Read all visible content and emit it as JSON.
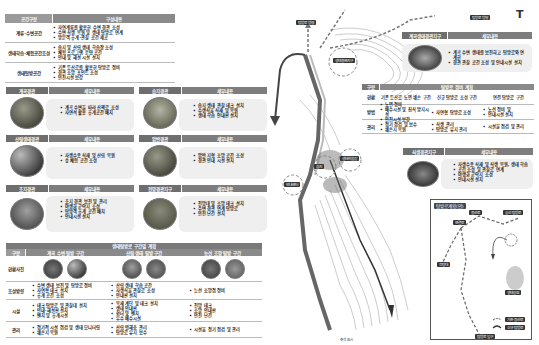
{
  "top_table": {
    "header": [
      "공간구분",
      "구성내용"
    ],
    "rows": [
      {
        "label": "계류·수변공간",
        "items": [
          "자연계류를 활용한 수변 경관 조성",
          "수변 식생 복원 및 생태 탐방로 연계",
          "방문객 휴게·관찰 공간 제공"
        ]
      },
      {
        "label": "생태학습·체험공간조성",
        "items": [
          "습지 및 산림 생태 학습장 조성",
          "체험 프로그램 운영 공간",
          "안내 및 해설 시설 설치"
        ]
      },
      {
        "label": "생태탐방공간",
        "items": [
          "기존 등산로를 활용한 탐방로 정비",
          "경관 조망 포인트 조성",
          "안전시설 보강"
        ]
      }
    ]
  },
  "cards": [
    {
      "title": "계곡경관",
      "subtitle": "세부내용",
      "items": [
        "계곡 수변을 따라 산책로 조성",
        "자연석 활용 휴게공간 배치"
      ]
    },
    {
      "title": "습지경관",
      "subtitle": "세부내용",
      "items": [
        "습지 생태 관찰 데크 설치",
        "수생식물 식재 및 복원",
        "생태 학습 안내판 설치"
      ]
    },
    {
      "title": "산림생태경관",
      "subtitle": "세부내용",
      "items": [
        "자생수종 식재 및 산림 복원",
        "숲 체험 공간 조성"
      ]
    },
    {
      "title": "암반경관",
      "subtitle": "세부내용",
      "items": [
        "암반 지형 조망 공간 조성",
        "경관 안내 시설 설치"
      ]
    },
    {
      "title": "초지경관",
      "subtitle": "세부내용",
      "items": [
        "초지 경관 보전 및 관리",
        "야생화 군락지 조성",
        "탐방객 휴게 공간 배치",
        "안내시설 설치"
      ]
    },
    {
      "title": "전망경관지구",
      "subtitle": "세부내용",
      "items": [
        "전망대 및 조망 데크 설치",
        "주변 경관 연계 탐방로",
        "안전 난간 설치"
      ]
    }
  ],
  "bottom_table": {
    "title": "생태탐방로 구간별 계획",
    "columns": [
      "구분",
      "계곡 수변 탐방 구간",
      "산림 생태 탐방 구간",
      "능선 조망 탐방 구간"
    ],
    "rows": [
      {
        "label": "현황사진",
        "cells": [
          "",
          "",
          ""
        ]
      },
      {
        "label": "조성방향",
        "cells": [
          [
            "수변 생태 보전 및 탐방로 정비",
            "자연형 데크 설치",
            "휴게 공간 조성"
          ],
          [
            "산림 생태 학습 공간",
            "자생식물 관찰로 조성",
            "안내판 설치",
            "쉼터 조성"
          ],
          [
            "능선 조망점 정비"
          ]
        ]
      },
      {
        "label": "시설",
        "cells": [
          [
            "데크 탐방로 및 관찰대 설치",
            "안내·해설판 설치",
            "벤치 및 휴게시설"
          ],
          [
            "목재 계단 및 데크 설치",
            "생태 안내판",
            "쉼터 및 벤치",
            "우수 배수시설"
          ],
          [
            "전망 데크",
            "조망 안내판",
            "안전 난간"
          ]
        ]
      },
      {
        "label": "관리",
        "cells": [
          [
            "정기적 시설 점검 및 생태 모니터링",
            "훼손지 복원"
          ],
          [
            "산림 병해충 관리",
            "탐방로 유지 보수"
          ],
          [
            "시설물 정기 점검 및 관리"
          ]
        ]
      }
    ]
  },
  "right_top_card": {
    "title": "계곡생태경관지구",
    "subtitle": "세부내용",
    "items": [
      "계곡 수변 생태를 보전하고 탐방로와 연계한",
      "경관 관찰 공간 조성 및 안내시설 설치"
    ]
  },
  "right_table": {
    "title": "탐방로 정비 계획",
    "columns": [
      "구분",
      "기존 등산로 정비",
      "신규 탐방로 조성",
      "연결 탐방로 정비"
    ],
    "rows": [
      {
        "label": "현황",
        "cells": [
          "기존 등산로 노면 훼손 구간",
          "신규 탐방로 조성 구간",
          "연결 탐방로 구간"
        ]
      },
      {
        "label": "방법",
        "cells": [
          [
            "노면 정비",
            "배수시설 및 침식 방지시설",
            "안전시설 보강"
          ],
          [
            "자연형 탐방로 조성"
          ],
          [
            "노선 정비 및",
            "안내시설 설치"
          ]
        ]
      },
      {
        "label": "관리",
        "cells": [
          [
            "정기 점검 및 보수",
            "훼손지 복원"
          ],
          [
            "식생 관리",
            "탐방로 유지 관리"
          ],
          [
            "시설물 점검 및 관리"
          ]
        ]
      }
    ]
  },
  "right_card2": {
    "title": "식생경관지구",
    "subtitle": "세부내용",
    "items": [
      "자생수종 식재 및 식생 복원, 생태 학습",
      "공간 조성 및 관찰로 연계",
      "야생화 군락지 조성",
      "안내시설 설치"
    ]
  },
  "map": {
    "labels": [
      "탐방로 방향",
      "생태경관지구",
      "계곡 경관",
      "주차장",
      "습지",
      "생태학습장",
      "안내센터",
      "전망대",
      "탐방로 방향",
      "유입부"
    ],
    "north_arrow": "T",
    "scale": "축척 표시"
  },
  "inset": {
    "title": "탐방로계획(안)",
    "labels": [
      "등산로",
      "능선 탐방로",
      "연결로",
      "전망대",
      "생태공원",
      "탐방로 입구"
    ],
    "legend": [
      "기존 등산로",
      "신규 탐방로"
    ]
  }
}
